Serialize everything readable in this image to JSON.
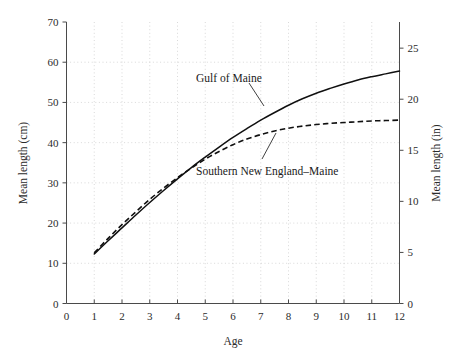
{
  "chart_data": {
    "type": "line",
    "title": "",
    "xlabel": "Age",
    "ylabel": "Mean length (cm)",
    "ylabel_right": "Mean length (in)",
    "xlim": [
      0,
      12
    ],
    "ylim": [
      0,
      70
    ],
    "ylim_right": [
      0,
      27.56
    ],
    "grid": true,
    "legend": "inline-annotations",
    "xticks": [
      0,
      1,
      2,
      3,
      4,
      5,
      6,
      7,
      8,
      9,
      10,
      11,
      12
    ],
    "xtick_labels": [
      "0",
      "1",
      "2",
      "3",
      "4",
      "5",
      "6",
      "7",
      "8",
      "9",
      "10",
      "11",
      "12"
    ],
    "yticks": [
      0,
      10,
      20,
      30,
      40,
      50,
      60,
      70
    ],
    "ytick_labels": [
      "0",
      "10",
      "20",
      "30",
      "40",
      "50",
      "60",
      "70"
    ],
    "yticks_right": [
      0,
      5,
      10,
      15,
      20,
      25
    ],
    "ytick_labels_right": [
      "0",
      "5",
      "10",
      "15",
      "20",
      "25"
    ],
    "x": [
      1,
      1.5,
      2,
      2.5,
      3,
      3.5,
      4,
      4.5,
      5,
      5.5,
      6,
      6.5,
      7,
      7.5,
      8,
      8.5,
      9,
      9.5,
      10,
      10.5,
      11,
      11.5,
      12
    ],
    "series": [
      {
        "name": "Gulf of Maine",
        "style": "solid",
        "values": [
          12.3,
          15.6,
          18.8,
          22.0,
          25.1,
          28.1,
          31.0,
          33.8,
          36.4,
          38.9,
          41.3,
          43.5,
          45.6,
          47.5,
          49.3,
          50.9,
          52.3,
          53.5,
          54.6,
          55.6,
          56.4,
          57.1,
          57.8
        ]
      },
      {
        "name": "Southern New England–Maine",
        "style": "dashed",
        "values": [
          12.6,
          16.2,
          19.6,
          22.8,
          25.9,
          28.7,
          31.3,
          33.7,
          35.9,
          37.8,
          39.5,
          40.9,
          42.0,
          42.9,
          43.6,
          44.1,
          44.5,
          44.8,
          45.0,
          45.2,
          45.4,
          45.5,
          45.6
        ]
      }
    ],
    "annotations": [
      {
        "text": "Gulf of Maine",
        "x_text": 4.5,
        "y_text": 57.5
      },
      {
        "text": "Southern New England–Maine",
        "x_text": 5.0,
        "y_text": 33.0
      }
    ]
  }
}
